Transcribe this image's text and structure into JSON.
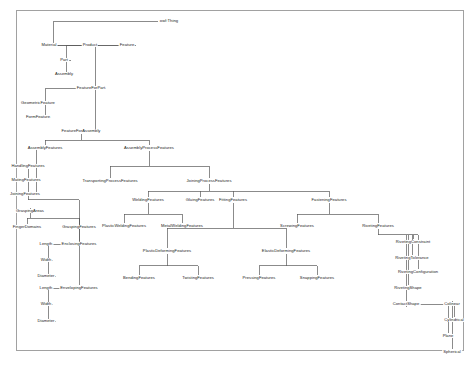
{
  "diagram": {
    "type": "ontology-tree",
    "title": "owl:Thing",
    "frame_color": "#8a8a8a",
    "edge_color": "#5a5a5a",
    "text_color": "#1a1a1a",
    "background": "#ffffff",
    "nodes": [
      {
        "id": "owlThing",
        "label": "owl:Thing",
        "x": 169,
        "y": 21
      },
      {
        "id": "Material",
        "label": "Material",
        "x": 49,
        "y": 45
      },
      {
        "id": "Product",
        "label": "Product",
        "x": 90,
        "y": 45
      },
      {
        "id": "Feature",
        "label": "Feature",
        "x": 127,
        "y": 45
      },
      {
        "id": "Part",
        "label": "Part",
        "x": 64,
        "y": 60
      },
      {
        "id": "Assembly",
        "label": "Assembly",
        "x": 64,
        "y": 74
      },
      {
        "id": "FeatureForPart",
        "label": "FeatureForPart",
        "x": 91,
        "y": 88
      },
      {
        "id": "GeometricFeature",
        "label": "GeometricFeature",
        "x": 38,
        "y": 103
      },
      {
        "id": "FormFeature",
        "label": "FormFeature",
        "x": 38,
        "y": 117
      },
      {
        "id": "FeatureForAssembly",
        "label": "FeatureForAssembly",
        "x": 81,
        "y": 131
      },
      {
        "id": "AssemblyFeatures",
        "label": "AssemblyFeatures",
        "x": 45,
        "y": 148
      },
      {
        "id": "AssemblyProcessFeatures",
        "label": "AssemblyProcessFeatures",
        "x": 149,
        "y": 148
      },
      {
        "id": "HandlingFeatures",
        "label": "HandlingFeatures",
        "x": 28,
        "y": 166
      },
      {
        "id": "MatingFeatures",
        "label": "MatingFeatures",
        "x": 26,
        "y": 180
      },
      {
        "id": "JoiningFeatures",
        "label": "JoiningFeatures",
        "x": 25,
        "y": 194
      },
      {
        "id": "GraspingAreas",
        "label": "GraspingAreas",
        "x": 30,
        "y": 211
      },
      {
        "id": "FingerDomains",
        "label": "FingerDomains",
        "x": 27,
        "y": 227
      },
      {
        "id": "GraspingFeatures",
        "label": "GraspingFeatures",
        "x": 79,
        "y": 227
      },
      {
        "id": "EnclosingFeatures",
        "label": "EnclosingFeatures",
        "x": 79,
        "y": 244
      },
      {
        "id": "Length1",
        "label": "Length",
        "x": 46,
        "y": 244
      },
      {
        "id": "Width1",
        "label": "Width",
        "x": 46,
        "y": 260
      },
      {
        "id": "Diameter1",
        "label": "Diameter",
        "x": 46,
        "y": 276
      },
      {
        "id": "EnvelopingFeatures",
        "label": "EnvelopingFeatures",
        "x": 79,
        "y": 288
      },
      {
        "id": "Length2",
        "label": "Length",
        "x": 46,
        "y": 288
      },
      {
        "id": "Width2",
        "label": "Width",
        "x": 46,
        "y": 304
      },
      {
        "id": "Diameter2",
        "label": "Diameter",
        "x": 46,
        "y": 321
      },
      {
        "id": "TransportingProcessFeatures",
        "label": "TransportingProcessFeatures",
        "x": 110,
        "y": 181
      },
      {
        "id": "JoiningProcessFeatures",
        "label": "JoiningProcessFeatures",
        "x": 209,
        "y": 181
      },
      {
        "id": "WeldingFeatures",
        "label": "WeldingFeatures",
        "x": 148,
        "y": 200
      },
      {
        "id": "GluingFeatures",
        "label": "GluingFeatures",
        "x": 200,
        "y": 200
      },
      {
        "id": "FittingFeatures",
        "label": "FittingFeatures",
        "x": 233,
        "y": 200
      },
      {
        "id": "FasteningFeatures",
        "label": "FasteningFeatures",
        "x": 329,
        "y": 200
      },
      {
        "id": "PlasticWeldingFeatures",
        "label": "PlasticWeldingFeatures",
        "x": 124,
        "y": 226
      },
      {
        "id": "MetalWeldingFeatures",
        "label": "MetalWeldingFeatures",
        "x": 182,
        "y": 226
      },
      {
        "id": "ScrewingFeatures",
        "label": "ScrewingFeatures",
        "x": 297,
        "y": 226
      },
      {
        "id": "RivetingFeatures",
        "label": "RivetingFeatures",
        "x": 378,
        "y": 226
      },
      {
        "id": "PlasticDeformingFeatures",
        "label": "PlasticDeformingFeatures",
        "x": 167,
        "y": 251
      },
      {
        "id": "ElasticDeformingFeatures",
        "label": "ElasticDeformingFeatures",
        "x": 286,
        "y": 251
      },
      {
        "id": "BendingFeatures",
        "label": "BendingFeatures",
        "x": 139,
        "y": 278
      },
      {
        "id": "TwistingFeatures",
        "label": "TwistingFeatures",
        "x": 198,
        "y": 278
      },
      {
        "id": "PressingFeatures",
        "label": "PressingFeatures",
        "x": 259,
        "y": 278
      },
      {
        "id": "SnappingFeatures",
        "label": "SnappingFeatures",
        "x": 317,
        "y": 278
      },
      {
        "id": "RivetingConstraint",
        "label": "RivetingConstraint",
        "x": 413,
        "y": 242
      },
      {
        "id": "RivetingTolerance",
        "label": "RivetingTolerance",
        "x": 412,
        "y": 258
      },
      {
        "id": "RivetingConfiguration",
        "label": "RivetingConfiguration",
        "x": 418,
        "y": 272
      },
      {
        "id": "RivetingShape",
        "label": "RivetingShape",
        "x": 408,
        "y": 288
      },
      {
        "id": "ContactShape",
        "label": "ContactShape",
        "x": 406,
        "y": 304
      },
      {
        "id": "Colinear",
        "label": "Colinear",
        "x": 452,
        "y": 304
      },
      {
        "id": "Cylindrical",
        "label": "Cylindrical",
        "x": 454,
        "y": 320
      },
      {
        "id": "Plane",
        "label": "Plane",
        "x": 448,
        "y": 336
      },
      {
        "id": "Spherical",
        "label": "Spherical",
        "x": 452,
        "y": 352
      }
    ],
    "edges": [
      {
        "from": "owlThing",
        "to": "Material"
      },
      {
        "from": "owlThing",
        "to": "Product"
      },
      {
        "from": "owlThing",
        "to": "Feature"
      },
      {
        "from": "Product",
        "to": "Part"
      },
      {
        "from": "Product",
        "to": "Assembly"
      },
      {
        "from": "Feature",
        "to": "FeatureForPart"
      },
      {
        "from": "FeatureForPart",
        "to": "GeometricFeature"
      },
      {
        "from": "FeatureForPart",
        "to": "FormFeature"
      },
      {
        "from": "Feature",
        "to": "FeatureForAssembly"
      },
      {
        "from": "FeatureForAssembly",
        "to": "AssemblyFeatures"
      },
      {
        "from": "FeatureForAssembly",
        "to": "AssemblyProcessFeatures"
      },
      {
        "from": "AssemblyFeatures",
        "to": "HandlingFeatures"
      },
      {
        "from": "AssemblyFeatures",
        "to": "MatingFeatures"
      },
      {
        "from": "AssemblyFeatures",
        "to": "JoiningFeatures"
      },
      {
        "from": "HandlingFeatures",
        "to": "GraspingFeatures"
      },
      {
        "from": "GraspingFeatures",
        "to": "GraspingAreas"
      },
      {
        "from": "GraspingFeatures",
        "to": "FingerDomains"
      },
      {
        "from": "GraspingFeatures",
        "to": "EnclosingFeatures"
      },
      {
        "from": "GraspingFeatures",
        "to": "EnvelopingFeatures"
      },
      {
        "from": "EnclosingFeatures",
        "to": "Length1"
      },
      {
        "from": "EnclosingFeatures",
        "to": "Width1"
      },
      {
        "from": "EnclosingFeatures",
        "to": "Diameter1"
      },
      {
        "from": "EnvelopingFeatures",
        "to": "Length2"
      },
      {
        "from": "EnvelopingFeatures",
        "to": "Width2"
      },
      {
        "from": "EnvelopingFeatures",
        "to": "Diameter2"
      },
      {
        "from": "AssemblyProcessFeatures",
        "to": "TransportingProcessFeatures"
      },
      {
        "from": "AssemblyProcessFeatures",
        "to": "JoiningProcessFeatures"
      },
      {
        "from": "JoiningProcessFeatures",
        "to": "WeldingFeatures"
      },
      {
        "from": "JoiningProcessFeatures",
        "to": "GluingFeatures"
      },
      {
        "from": "JoiningProcessFeatures",
        "to": "FittingFeatures"
      },
      {
        "from": "JoiningProcessFeatures",
        "to": "FasteningFeatures"
      },
      {
        "from": "WeldingFeatures",
        "to": "PlasticWeldingFeatures"
      },
      {
        "from": "WeldingFeatures",
        "to": "MetalWeldingFeatures"
      },
      {
        "from": "FasteningFeatures",
        "to": "ScrewingFeatures"
      },
      {
        "from": "FasteningFeatures",
        "to": "RivetingFeatures"
      },
      {
        "from": "FittingFeatures",
        "to": "PlasticDeformingFeatures"
      },
      {
        "from": "FittingFeatures",
        "to": "ElasticDeformingFeatures"
      },
      {
        "from": "PlasticDeformingFeatures",
        "to": "BendingFeatures"
      },
      {
        "from": "PlasticDeformingFeatures",
        "to": "TwistingFeatures"
      },
      {
        "from": "ElasticDeformingFeatures",
        "to": "PressingFeatures"
      },
      {
        "from": "ElasticDeformingFeatures",
        "to": "SnappingFeatures"
      },
      {
        "from": "RivetingFeatures",
        "to": "RivetingConstraint"
      },
      {
        "from": "RivetingFeatures",
        "to": "RivetingTolerance"
      },
      {
        "from": "RivetingFeatures",
        "to": "RivetingConfiguration"
      },
      {
        "from": "RivetingFeatures",
        "to": "RivetingShape"
      },
      {
        "from": "RivetingFeatures",
        "to": "ContactShape"
      },
      {
        "from": "ContactShape",
        "to": "Colinear"
      },
      {
        "from": "ContactShape",
        "to": "Cylindrical"
      },
      {
        "from": "ContactShape",
        "to": "Plane"
      },
      {
        "from": "ContactShape",
        "to": "Spherical"
      }
    ]
  }
}
